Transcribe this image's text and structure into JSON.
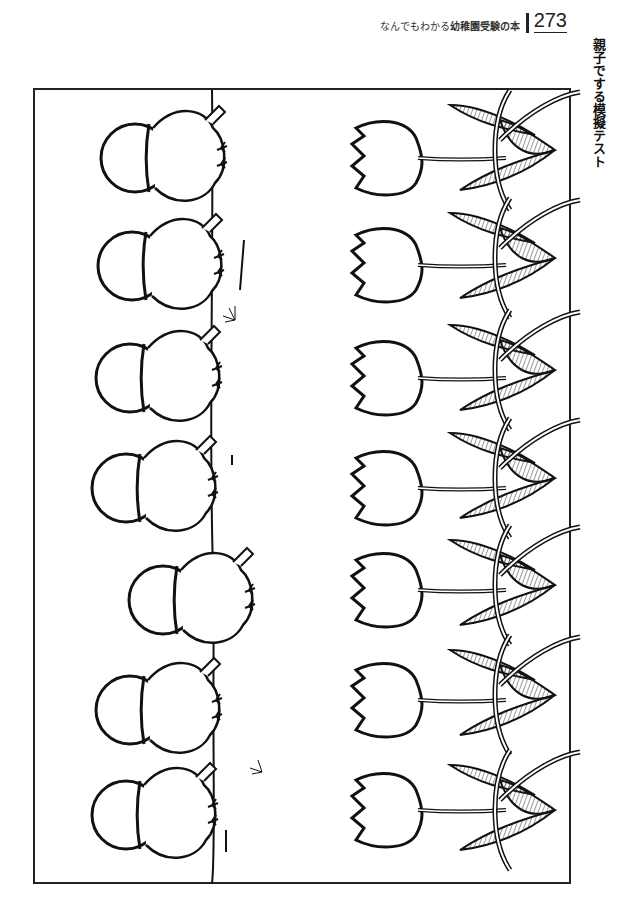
{
  "header": {
    "book_title_prefix": "なんでもわかる",
    "book_title_bold": "幼稚園受験の本",
    "page_number": "273"
  },
  "side_title": "親子でする模擬テスト",
  "worksheet": {
    "rows": 7,
    "columns": [
      {
        "name": "chicks-with-shells",
        "icon": "chick-icon"
      },
      {
        "name": "tulip-flowers",
        "icon": "tulip-icon"
      },
      {
        "name": "tulip-leaves-stems",
        "icon": "leaf-icon"
      }
    ]
  }
}
